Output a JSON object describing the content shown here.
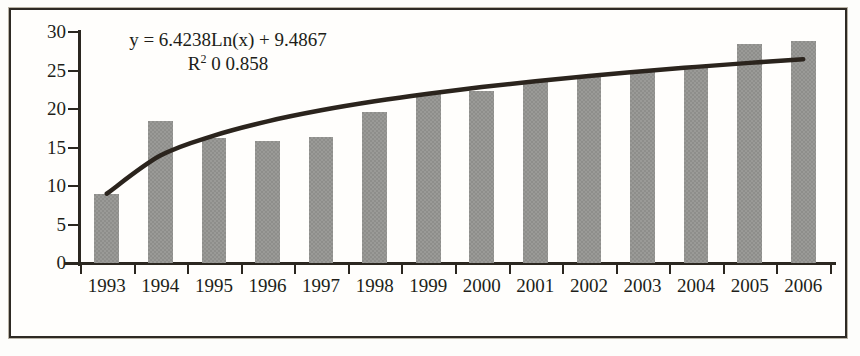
{
  "chart_data": {
    "type": "bar",
    "title": "",
    "subtitle": "",
    "xlabel": "",
    "ylabel": "",
    "categories": [
      "1993",
      "1994",
      "1995",
      "1996",
      "1997",
      "1998",
      "1999",
      "2000",
      "2001",
      "2002",
      "2003",
      "2004",
      "2005",
      "2006"
    ],
    "series": [
      {
        "name": "bars",
        "type": "bar",
        "values": [
          9.0,
          18.4,
          16.3,
          15.8,
          16.4,
          19.6,
          22.1,
          22.4,
          23.6,
          24.1,
          24.8,
          25.6,
          28.4,
          28.8
        ]
      },
      {
        "name": "logarithmic-trendline",
        "type": "line",
        "values": [
          9.0,
          13.95,
          16.55,
          18.4,
          19.83,
          21.0,
          21.99,
          22.85,
          23.61,
          24.29,
          24.9,
          25.47,
          25.99,
          26.47
        ]
      }
    ],
    "ylim": [
      0,
      30
    ],
    "ytick_values": [
      0,
      5,
      10,
      15,
      20,
      25,
      30
    ],
    "ytick_labels": [
      "0",
      "5",
      "10",
      "15",
      "20",
      "25",
      "30"
    ],
    "grid": false,
    "legend": false,
    "legend_position": "none",
    "annotations": {
      "equation": "y = 6.4238Ln(x) + 9.4867",
      "r_squared_prefix": "R",
      "r_squared_exponent": "2",
      "r_squared_value": " 0 0.858"
    },
    "colors": {
      "bar_fill": "#8e8e8b",
      "trendline": "#2b241d",
      "axis": "#2b2720",
      "text": "#211e19",
      "frame": "#2e2a24",
      "background": "#fffefc"
    }
  }
}
